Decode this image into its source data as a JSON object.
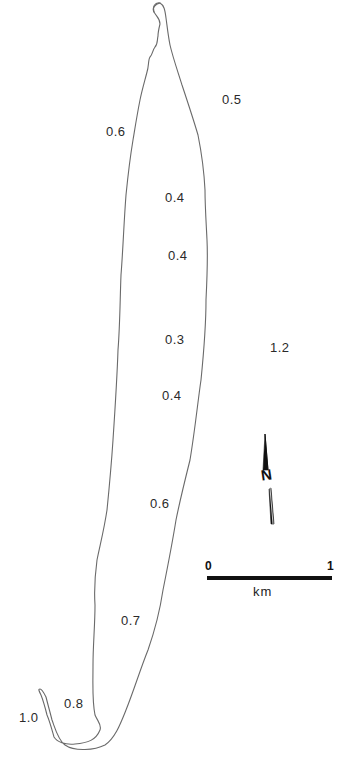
{
  "map": {
    "type": "lake-outline",
    "feature_color": "#6a6a6a",
    "labels": [
      {
        "id": "v1",
        "text": "0.5",
        "x": 222,
        "y": 93
      },
      {
        "id": "v2",
        "text": "0.6",
        "x": 106,
        "y": 125
      },
      {
        "id": "v3",
        "text": "0.4",
        "x": 165,
        "y": 191
      },
      {
        "id": "v4",
        "text": "0.4",
        "x": 168,
        "y": 249
      },
      {
        "id": "v5",
        "text": "0.3",
        "x": 165,
        "y": 333
      },
      {
        "id": "v6",
        "text": "1.2",
        "x": 270,
        "y": 341
      },
      {
        "id": "v7",
        "text": "0.4",
        "x": 162,
        "y": 389
      },
      {
        "id": "v8",
        "text": "0.6",
        "x": 150,
        "y": 497
      },
      {
        "id": "v9",
        "text": "0.7",
        "x": 121,
        "y": 614
      },
      {
        "id": "v10",
        "text": "0.8",
        "x": 64,
        "y": 697
      },
      {
        "id": "v11",
        "text": "1.0",
        "x": 19,
        "y": 711
      }
    ]
  },
  "north_arrow": {
    "icon": "north-arrow-icon",
    "letter": "N"
  },
  "scale_bar": {
    "start_label": "0",
    "end_label": "1",
    "unit": "km",
    "color": "#111111"
  }
}
